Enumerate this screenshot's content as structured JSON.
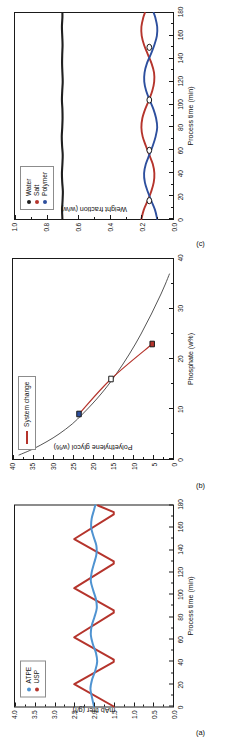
{
  "figure": {
    "panels": [
      "c",
      "b",
      "a"
    ],
    "colors": {
      "red": "#b5342c",
      "blue": "#4f93d1",
      "dark_blue": "#2d4f9e",
      "water_black": "#1f1f1f",
      "curve_gray": "#555555",
      "tie_line_red": "#b5342c"
    }
  },
  "panel_c": {
    "tag": "(c)",
    "legend": {
      "items": [
        {
          "label": "Water",
          "color": "#1f1f1f"
        },
        {
          "label": "Salt",
          "color": "#b5342c"
        },
        {
          "label": "Polymer",
          "color": "#2d4f9e"
        }
      ]
    }
  },
  "panel_b": {
    "tag": "(b)",
    "legend": {
      "items": [
        {
          "label": "System change",
          "color": "#b5342c"
        }
      ]
    }
  },
  "panel_a": {
    "tag": "(a)",
    "legend": {
      "items": [
        {
          "label": "ATPE",
          "color": "#4f93d1"
        },
        {
          "label": "USP",
          "color": "#b5342c"
        }
      ]
    }
  },
  "chart_data": [
    {
      "id": "c",
      "type": "line",
      "title": "",
      "xlabel": "Process time (min)",
      "ylabel": "Weight fraction (w/w)",
      "xlim": [
        0,
        180
      ],
      "ylim": [
        0.0,
        1.0
      ],
      "xticks": [
        0,
        20,
        40,
        60,
        80,
        100,
        120,
        140,
        160,
        180
      ],
      "xticklabels": [
        "0",
        "20",
        "40",
        "60",
        "80",
        "100",
        "120",
        "140",
        "160",
        "180"
      ],
      "yticks": [
        0.0,
        0.2,
        0.4,
        0.6,
        0.8,
        1.0
      ],
      "yticklabels": [
        "0.0",
        "0.2",
        "0.4",
        "0.6",
        "0.8",
        "1.0"
      ],
      "grid": false,
      "legend_position": "upper left",
      "series": [
        {
          "name": "Water",
          "color": "#1f1f1f",
          "x": [
            0,
            8,
            16,
            24,
            32,
            40,
            48,
            56,
            64,
            72,
            80,
            88,
            96,
            104,
            112,
            120,
            128,
            136,
            144,
            152,
            160,
            168,
            176,
            180
          ],
          "values": [
            0.7,
            0.702,
            0.699,
            0.697,
            0.701,
            0.703,
            0.7,
            0.698,
            0.702,
            0.704,
            0.701,
            0.699,
            0.7,
            0.703,
            0.701,
            0.698,
            0.7,
            0.702,
            0.701,
            0.699,
            0.701,
            0.703,
            0.7,
            0.7
          ]
        },
        {
          "name": "Salt",
          "color": "#b5342c",
          "x": [
            0,
            8,
            16,
            24,
            32,
            40,
            48,
            56,
            64,
            72,
            80,
            88,
            96,
            104,
            112,
            120,
            128,
            136,
            144,
            152,
            160,
            168,
            176,
            180
          ],
          "values": [
            0.2,
            0.185,
            0.16,
            0.138,
            0.122,
            0.118,
            0.128,
            0.15,
            0.172,
            0.192,
            0.2,
            0.194,
            0.176,
            0.152,
            0.131,
            0.119,
            0.12,
            0.136,
            0.16,
            0.183,
            0.198,
            0.2,
            0.188,
            0.178
          ]
        },
        {
          "name": "Polymer",
          "color": "#2d4f9e",
          "x": [
            0,
            8,
            16,
            24,
            32,
            40,
            48,
            56,
            64,
            72,
            80,
            88,
            96,
            104,
            112,
            120,
            128,
            136,
            144,
            152,
            160,
            168,
            176,
            180
          ],
          "values": [
            0.1,
            0.114,
            0.138,
            0.16,
            0.178,
            0.183,
            0.172,
            0.15,
            0.128,
            0.11,
            0.1,
            0.107,
            0.124,
            0.148,
            0.17,
            0.182,
            0.18,
            0.165,
            0.14,
            0.118,
            0.102,
            0.1,
            0.112,
            0.122
          ]
        }
      ],
      "markers": {
        "note": "open circles mark crossing points of Salt and Polymer",
        "x": [
          16,
          60,
          104,
          150
        ],
        "y": [
          0.15,
          0.15,
          0.15,
          0.15
        ]
      }
    },
    {
      "id": "b",
      "type": "line",
      "title": "",
      "xlabel": "Phosphate (w%)",
      "ylabel": "Polyethylene glycol (w%)",
      "xlim": [
        0,
        40
      ],
      "ylim": [
        0,
        40
      ],
      "xticks": [
        0,
        10,
        20,
        30,
        40
      ],
      "xticklabels": [
        "0",
        "10",
        "20",
        "30",
        "40"
      ],
      "yticks": [
        0,
        5,
        10,
        15,
        20,
        25,
        30,
        35,
        40
      ],
      "yticklabels": [
        "0",
        "5",
        "10",
        "15",
        "20",
        "25",
        "30",
        "35",
        "40"
      ],
      "grid": false,
      "legend_position": "upper left",
      "series": [
        {
          "name": "Binodal curve",
          "color": "#555555",
          "x": [
            0.8,
            2,
            3.5,
            5,
            7,
            9,
            11,
            13,
            15,
            17,
            19,
            21,
            23,
            25,
            27,
            29,
            31,
            33,
            35,
            37
          ],
          "values": [
            38.5,
            35.0,
            31.5,
            28.5,
            25.2,
            22.6,
            20.2,
            18.0,
            16.0,
            14.2,
            12.5,
            10.9,
            9.4,
            8.0,
            6.7,
            5.4,
            4.2,
            3.0,
            1.9,
            0.9
          ]
        },
        {
          "name": "System change",
          "color": "#b5342c",
          "x": [
            9,
            16,
            23
          ],
          "values": [
            23.5,
            15.5,
            5.2
          ]
        }
      ],
      "markers": [
        {
          "x": 9,
          "y": 23.5,
          "fill": "#2d4f9e",
          "style": "filled-square"
        },
        {
          "x": 16,
          "y": 15.5,
          "fill": "#ffffff",
          "style": "open-square"
        },
        {
          "x": 23,
          "y": 5.2,
          "fill": "#b5342c",
          "style": "filled-square"
        }
      ]
    },
    {
      "id": "a",
      "type": "line",
      "title": "",
      "xlabel": "Process time (min)",
      "ylabel": "mAb titer (g/l)",
      "xlim": [
        0,
        180
      ],
      "ylim": [
        0.0,
        4.0
      ],
      "xticks": [
        0,
        20,
        40,
        60,
        80,
        100,
        120,
        140,
        160,
        180
      ],
      "xticklabels": [
        "0",
        "20",
        "40",
        "60",
        "80",
        "100",
        "120",
        "140",
        "160",
        "180"
      ],
      "yticks": [
        0.0,
        0.5,
        1.0,
        1.5,
        2.0,
        2.5,
        3.0,
        3.5,
        4.0
      ],
      "yticklabels": [
        "0.0",
        "0.5",
        "1.0",
        "1.5",
        "2.0",
        "2.5",
        "3.0",
        "3.5",
        "4.0"
      ],
      "grid": false,
      "legend_position": "upper left",
      "series": [
        {
          "name": "USP",
          "color": "#b5342c",
          "x": [
            0,
            20,
            40,
            42,
            62,
            84,
            86,
            106,
            128,
            130,
            150,
            172,
            174,
            180
          ],
          "values": [
            1.5,
            2.5,
            1.5,
            1.5,
            2.5,
            1.5,
            1.5,
            2.5,
            1.5,
            1.5,
            2.5,
            1.5,
            1.5,
            1.9
          ]
        },
        {
          "name": "ATPE",
          "color": "#4f93d1",
          "x": [
            0,
            8,
            16,
            24,
            32,
            40,
            48,
            56,
            64,
            72,
            80,
            88,
            96,
            104,
            112,
            120,
            128,
            136,
            144,
            152,
            160,
            168,
            176,
            180
          ],
          "values": [
            2.0,
            2.05,
            2.09,
            2.05,
            1.97,
            1.92,
            1.95,
            2.03,
            2.08,
            2.06,
            1.99,
            1.93,
            1.95,
            2.02,
            2.08,
            2.06,
            2.0,
            1.94,
            1.94,
            2.01,
            2.07,
            2.06,
            2.0,
            1.97
          ]
        }
      ]
    }
  ]
}
